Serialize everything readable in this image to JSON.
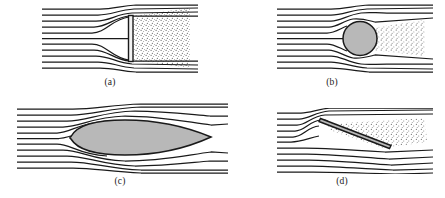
{
  "figure": {
    "background_color": "#ffffff",
    "line_color": "#1a1a1a",
    "body_fill_gray": "#b8b8b8",
    "body_fill_white": "#f2f2f2",
    "stipple_color": "#2b2b2b",
    "width": 445,
    "height": 198
  },
  "panels": [
    {
      "id": "a",
      "caption": "(a)",
      "body": "flat-plate-normal-to-flow",
      "body_fill": "#f2f2f2",
      "wake": "large-separated-wake",
      "streamline_count": 11,
      "caption_x": 108,
      "caption_y": 77
    },
    {
      "id": "b",
      "caption": "(b)",
      "body": "circular-cylinder",
      "body_fill": "#b8b8b8",
      "wake": "moderate-separated-wake",
      "streamline_count": 11,
      "caption_x": 330,
      "caption_y": 77
    },
    {
      "id": "c",
      "caption": "(c)",
      "body": "streamlined-airfoil",
      "body_fill": "#b8b8b8",
      "wake": "attached-flow-minimal-wake",
      "streamline_count": 11,
      "caption_x": 118,
      "caption_y": 176
    },
    {
      "id": "d",
      "caption": "(d)",
      "body": "inclined-flat-plate",
      "body_fill": "#b8b8b8",
      "wake": "separated-flow-above-plate",
      "streamline_count": 11,
      "caption_x": 340,
      "caption_y": 176
    }
  ]
}
